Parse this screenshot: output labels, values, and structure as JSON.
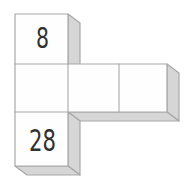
{
  "figure": {
    "labels": {
      "top_square": "8",
      "bottom_square": "28"
    }
  },
  "colors": {
    "background": "#ffffff",
    "front_face": "#fefefe",
    "side_face": "#d6d6d6",
    "outline": "#a8a8a8",
    "label_text": "#303030"
  }
}
